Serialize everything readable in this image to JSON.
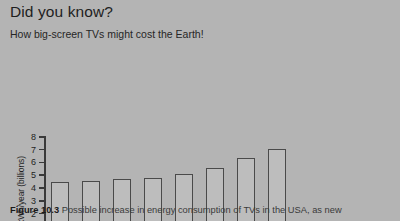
{
  "header": {
    "headline": "Did you know?",
    "subhead": "How big-screen TVs might cost the Earth!"
  },
  "caption": {
    "label": "Figure 10.3",
    "text": "Possible increase in energy consumption of TVs in the USA, as new"
  },
  "colors": {
    "background": "#b4b4b4",
    "bar_fill": "#bdbdbd",
    "bar_stroke": "#4a4a4a",
    "axis": "#3a3a3a",
    "text": "#1f1f1f"
  },
  "chart_data": {
    "type": "bar",
    "title": "",
    "xlabel": "",
    "ylabel": "kWh/year (billions)",
    "categories": [
      "2002",
      "2003",
      "2004",
      "2005",
      "2006",
      "2007",
      "2008",
      "2009"
    ],
    "values": [
      4.4,
      4.5,
      4.65,
      4.7,
      5.05,
      5.5,
      6.25,
      7.0
    ],
    "ylim": [
      0,
      8
    ],
    "yticks": [
      0,
      1,
      2,
      3,
      4,
      5,
      6,
      7,
      8
    ],
    "grid": false,
    "legend": null
  }
}
